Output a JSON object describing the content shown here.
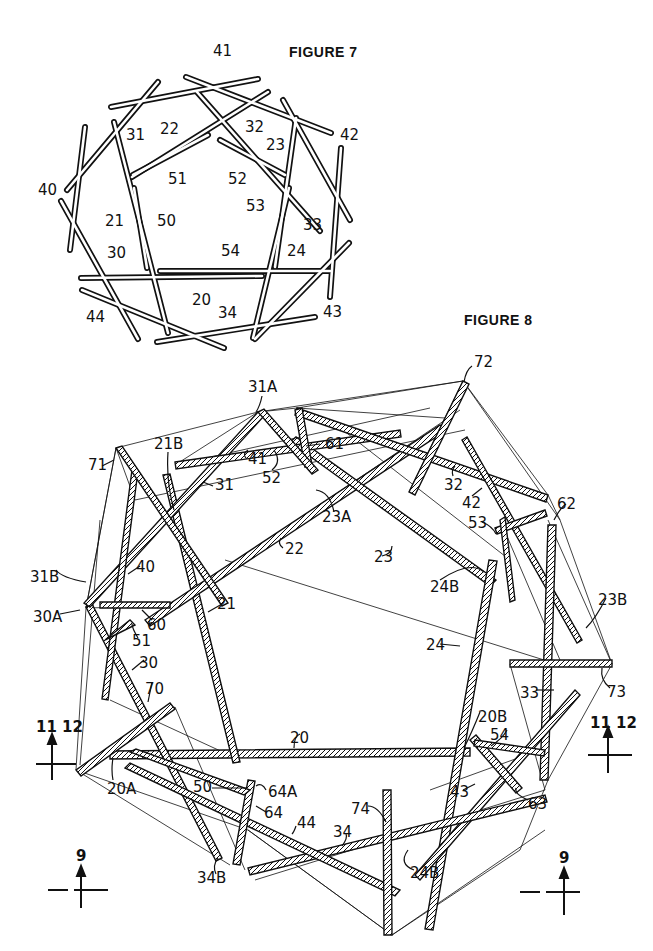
{
  "figure7": {
    "title": "FIGURE 7",
    "labels": [
      {
        "text": "41",
        "x": 213,
        "y": 52
      },
      {
        "text": "31",
        "x": 126,
        "y": 128
      },
      {
        "text": "22",
        "x": 160,
        "y": 122
      },
      {
        "text": "32",
        "x": 246,
        "y": 120
      },
      {
        "text": "23",
        "x": 267,
        "y": 140
      },
      {
        "text": "42",
        "x": 340,
        "y": 128
      },
      {
        "text": "51",
        "x": 167,
        "y": 172
      },
      {
        "text": "52",
        "x": 228,
        "y": 172
      },
      {
        "text": "40",
        "x": 40,
        "y": 181
      },
      {
        "text": "53",
        "x": 247,
        "y": 198
      },
      {
        "text": "21",
        "x": 106,
        "y": 214
      },
      {
        "text": "50",
        "x": 157,
        "y": 214
      },
      {
        "text": "33",
        "x": 303,
        "y": 216
      },
      {
        "text": "30",
        "x": 108,
        "y": 245
      },
      {
        "text": "54",
        "x": 222,
        "y": 244
      },
      {
        "text": "24",
        "x": 288,
        "y": 244
      },
      {
        "text": "20",
        "x": 192,
        "y": 293
      },
      {
        "text": "44",
        "x": 86,
        "y": 311
      },
      {
        "text": "34",
        "x": 218,
        "y": 306
      },
      {
        "text": "43",
        "x": 324,
        "y": 305
      }
    ]
  },
  "figure8": {
    "title": "FIGURE 8",
    "labels": [
      {
        "text": "72",
        "x": 475,
        "y": 357
      },
      {
        "text": "31A",
        "x": 248,
        "y": 380
      },
      {
        "text": "21B",
        "x": 154,
        "y": 437
      },
      {
        "text": "61",
        "x": 325,
        "y": 437
      },
      {
        "text": "71",
        "x": 88,
        "y": 460
      },
      {
        "text": "41",
        "x": 247,
        "y": 452
      },
      {
        "text": "52",
        "x": 262,
        "y": 471
      },
      {
        "text": "31",
        "x": 215,
        "y": 480
      },
      {
        "text": "32",
        "x": 444,
        "y": 480
      },
      {
        "text": "42",
        "x": 462,
        "y": 496
      },
      {
        "text": "23A",
        "x": 322,
        "y": 510
      },
      {
        "text": "62",
        "x": 557,
        "y": 497
      },
      {
        "text": "53",
        "x": 469,
        "y": 516
      },
      {
        "text": "22",
        "x": 285,
        "y": 542
      },
      {
        "text": "23",
        "x": 374,
        "y": 551
      },
      {
        "text": "31B",
        "x": 30,
        "y": 570
      },
      {
        "text": "40",
        "x": 136,
        "y": 560
      },
      {
        "text": "24B",
        "x": 430,
        "y": 580
      },
      {
        "text": "30A",
        "x": 33,
        "y": 610
      },
      {
        "text": "60",
        "x": 147,
        "y": 618
      },
      {
        "text": "21",
        "x": 217,
        "y": 599
      },
      {
        "text": "23B",
        "x": 598,
        "y": 593
      },
      {
        "text": "51",
        "x": 132,
        "y": 634
      },
      {
        "text": "24",
        "x": 426,
        "y": 639
      },
      {
        "text": "30",
        "x": 138,
        "y": 656
      },
      {
        "text": "70",
        "x": 145,
        "y": 682
      },
      {
        "text": "33",
        "x": 520,
        "y": 687
      },
      {
        "text": "73",
        "x": 607,
        "y": 685
      },
      {
        "text": "20",
        "x": 290,
        "y": 731
      },
      {
        "text": "20B",
        "x": 478,
        "y": 710
      },
      {
        "text": "54",
        "x": 490,
        "y": 728
      },
      {
        "text": "20A",
        "x": 107,
        "y": 782
      },
      {
        "text": "50",
        "x": 193,
        "y": 780
      },
      {
        "text": "64A",
        "x": 268,
        "y": 785
      },
      {
        "text": "43",
        "x": 451,
        "y": 785
      },
      {
        "text": "63",
        "x": 528,
        "y": 797
      },
      {
        "text": "64",
        "x": 264,
        "y": 808
      },
      {
        "text": "74",
        "x": 351,
        "y": 803
      },
      {
        "text": "44",
        "x": 297,
        "y": 818
      },
      {
        "text": "34",
        "x": 333,
        "y": 826
      },
      {
        "text": "34B",
        "x": 197,
        "y": 871
      },
      {
        "text": "24B",
        "x": 410,
        "y": 866
      }
    ]
  },
  "section_markers": [
    {
      "name": "section-11-12-left",
      "text": "11  12",
      "x": 36,
      "y": 726
    },
    {
      "name": "section-11-12-right",
      "text": "11  12",
      "x": 590,
      "y": 722
    },
    {
      "name": "section-9-left",
      "text": "9",
      "x": 76,
      "y": 850
    },
    {
      "name": "section-9-right",
      "text": "9",
      "x": 560,
      "y": 852
    }
  ],
  "colors": {
    "ink": "#111111",
    "paper": "#ffffff"
  }
}
